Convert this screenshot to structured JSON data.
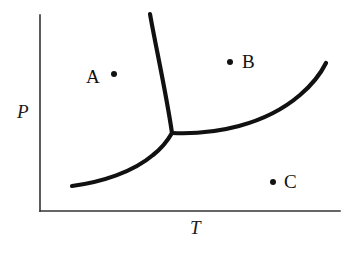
{
  "figure": {
    "width": 356,
    "height": 254,
    "background_color": "#ffffff",
    "line_color": "#111111",
    "axis_color": "#333333"
  },
  "axes": {
    "y_label": "P",
    "x_label": "T",
    "origin": {
      "x": 40,
      "y": 211
    },
    "y_axis_top": {
      "x": 40,
      "y": 15
    },
    "x_axis_right": {
      "x": 340,
      "y": 211
    },
    "ticks": [],
    "tick_labels": [],
    "grid": false
  },
  "markers": [
    {
      "id": "A",
      "label": "A",
      "label_side": "left",
      "dot_x": 114,
      "dot_y": 74,
      "radius": 3.0
    },
    {
      "id": "B",
      "label": "B",
      "label_side": "right",
      "dot_x": 230,
      "dot_y": 62,
      "radius": 3.0
    },
    {
      "id": "C",
      "label": "C",
      "label_side": "right",
      "dot_x": 273,
      "dot_y": 182,
      "radius": 3.0
    }
  ],
  "chart_data": {
    "type": "line",
    "title": "",
    "subtitle": "",
    "xlabel": "T",
    "ylabel": "P",
    "xlim": [
      40,
      340
    ],
    "ylim": [
      211,
      15
    ],
    "grid": false,
    "legend": "none",
    "axis_ticks": "none",
    "triple_point": {
      "x": 172,
      "y": 133
    },
    "series": [
      {
        "name": "fusion-curve",
        "description": "solid-liquid coexistence line, steep, rising from triple point to upper edge",
        "path": "M 150 14 C 156 48, 166 92, 172 133",
        "points": [
          [
            150,
            14
          ],
          [
            156,
            48
          ],
          [
            166,
            92
          ],
          [
            172,
            133
          ]
        ]
      },
      {
        "name": "vaporization-curve",
        "description": "liquid-vapour coexistence line, rising to the right from triple point",
        "path": "M 172 133 C 215 135, 265 125, 300 95 C 313 84, 321 73, 326 63",
        "points": [
          [
            172,
            133
          ],
          [
            215,
            135
          ],
          [
            265,
            125
          ],
          [
            300,
            95
          ],
          [
            313,
            84
          ],
          [
            321,
            73
          ],
          [
            326,
            63
          ]
        ]
      },
      {
        "name": "sublimation-curve",
        "description": "solid-vapour coexistence line, rising from lower left to triple point",
        "path": "M 72 186 C 102 182, 133 172, 153 155 C 162 148, 168 140, 172 133",
        "points": [
          [
            72,
            186
          ],
          [
            102,
            182
          ],
          [
            133,
            172
          ],
          [
            153,
            155
          ],
          [
            162,
            148
          ],
          [
            168,
            140
          ],
          [
            172,
            133
          ]
        ]
      }
    ],
    "annotations": [
      {
        "text": "A",
        "x": 114,
        "y": 74
      },
      {
        "text": "B",
        "x": 230,
        "y": 62
      },
      {
        "text": "C",
        "x": 273,
        "y": 182
      }
    ]
  }
}
